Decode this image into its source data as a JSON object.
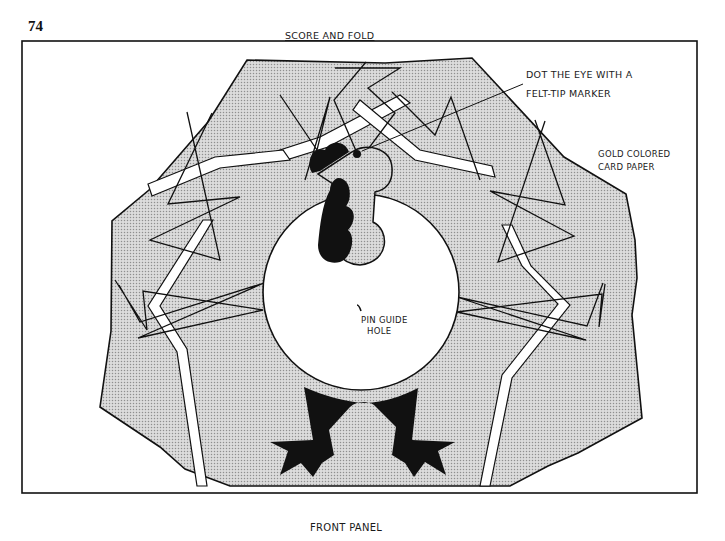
{
  "page": {
    "number": "74"
  },
  "labels": {
    "top_fold": "SCORE AND FOLD",
    "bottom_panel": "FRONT PANEL",
    "eye_instruction_line1": "DOT THE EYE WITH A",
    "eye_instruction_line2": "FELT-TIP MARKER",
    "paper_line1": "GOLD COLORED",
    "paper_line2": "CARD PAPER",
    "pin_line1": "PIN GUIDE",
    "pin_line2": "HOLE"
  },
  "colors": {
    "ink": "#111111",
    "paper": "#ffffff",
    "halftone_fill": "#d9d9d9",
    "halftone_dot": "#9a9a9a"
  },
  "diagram": {
    "parts": [
      "tail-fan",
      "head-and-neck",
      "wattle",
      "comb",
      "eye",
      "round-body",
      "legs-and-feet",
      "pin-guide-hole"
    ]
  }
}
